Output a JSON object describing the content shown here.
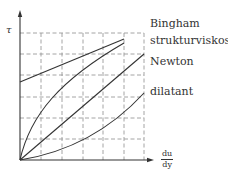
{
  "diagram": {
    "type": "flow-curves",
    "y_axis_label": "τ",
    "x_axis_label": {
      "numerator": "du",
      "denominator": "dy"
    },
    "curves": [
      {
        "id": "bingham",
        "label": "Bingham"
      },
      {
        "id": "strukturviskos",
        "label": "strukturviskos"
      },
      {
        "id": "newton",
        "label": "Newton"
      },
      {
        "id": "dilatant",
        "label": "dilatant"
      }
    ],
    "grid": {
      "columns": 6,
      "rows": 6,
      "style": "dashed"
    },
    "colors": {
      "line": "#333333",
      "grid": "#999999"
    }
  }
}
